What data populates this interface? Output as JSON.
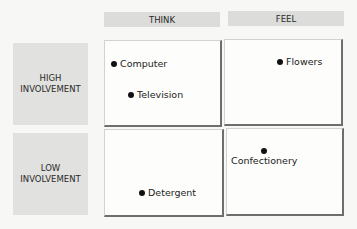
{
  "columns": [
    {
      "label": "THINK"
    },
    {
      "label": "FEEL"
    }
  ],
  "rows": [
    {
      "label": "HIGH\nINVOLVEMENT"
    },
    {
      "label": "LOW\nINVOLVEMENT"
    }
  ],
  "quadrants": {
    "high_think": {
      "items": [
        {
          "label": "Computer"
        },
        {
          "label": "Television"
        }
      ]
    },
    "high_feel": {
      "items": [
        {
          "label": "Flowers"
        }
      ]
    },
    "low_think": {
      "items": [
        {
          "label": "Detergent"
        }
      ]
    },
    "low_feel": {
      "items": [
        {
          "label": "Confectionery"
        }
      ]
    }
  },
  "colors": {
    "header_bg": "#dcdcda",
    "label_bg": "#e1e1df",
    "quadrant_bg": "#fdfdfc",
    "dot": "#111111"
  }
}
